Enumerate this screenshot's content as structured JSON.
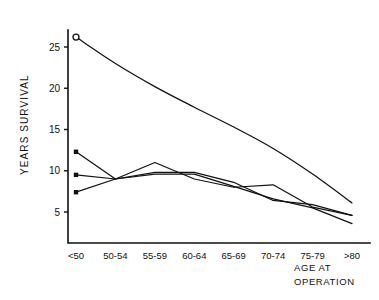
{
  "chart_data": {
    "type": "line",
    "title": "",
    "xlabel": "AGE AT OPERATION",
    "ylabel": "YEARS SURVIVAL",
    "categories": [
      "<50",
      "50-54",
      "55-59",
      "60-64",
      "65-69",
      "70-74",
      "75-79",
      ">80"
    ],
    "xlim": [
      0,
      7
    ],
    "ylim": [
      0,
      28
    ],
    "yticks": [
      5,
      10,
      15,
      20,
      25
    ],
    "ytick_labels": [
      "5",
      "10",
      "15",
      "20",
      "25"
    ],
    "grid": false,
    "legend": "none",
    "axis_style": "left-and-bottom-spine",
    "series": [
      {
        "name": "expected-survival-curve",
        "marker": "open-circle",
        "marker_at": [
          "<50"
        ],
        "smooth": true,
        "values": [
          26.2,
          23.0,
          20.2,
          17.7,
          15.3,
          12.7,
          9.6,
          6.1
        ]
      },
      {
        "name": "observed-series-1",
        "marker": "square",
        "marker_at": [
          "<50"
        ],
        "smooth": false,
        "values": [
          12.3,
          9.0,
          11.0,
          9.0,
          8.0,
          8.3,
          5.6,
          4.6
        ]
      },
      {
        "name": "observed-series-2",
        "marker": "square",
        "marker_at": [
          "<50"
        ],
        "smooth": false,
        "values": [
          9.5,
          9.0,
          9.8,
          9.8,
          8.6,
          6.4,
          5.9,
          4.6
        ]
      },
      {
        "name": "observed-series-3",
        "marker": "square",
        "marker_at": [
          "<50"
        ],
        "smooth": false,
        "values": [
          7.4,
          9.0,
          9.6,
          9.6,
          8.1,
          6.6,
          5.5,
          3.6
        ]
      }
    ]
  },
  "figure": {
    "background_color": "#ffffff",
    "ink_color": "#111111"
  }
}
